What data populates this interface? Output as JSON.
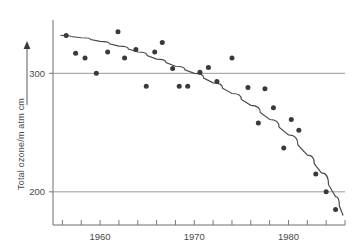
{
  "chart_data": {
    "type": "scatter",
    "title": "",
    "xlabel": "",
    "ylabel": "Total ozone/m atm cm",
    "xlim": [
      1955.0,
      1986.0
    ],
    "ylim": [
      172,
      345
    ],
    "grid": "horizontal gridlines at y = 200 and y = 300 only",
    "legend": "none",
    "x_tick_labels": [
      "1960",
      "1970",
      "1980"
    ],
    "x_tick_values": [
      1960,
      1970,
      1980
    ],
    "x_minor_tick_values": [
      1956,
      1958,
      1960,
      1962,
      1964,
      1966,
      1968,
      1970,
      1972,
      1974,
      1976,
      1978,
      1980,
      1982,
      1984,
      1986
    ],
    "y_tick_labels": [
      "300",
      "200"
    ],
    "y_tick_values": [
      300,
      200
    ],
    "series": [
      {
        "name": "Total ozone measurements",
        "marker": "filled circle",
        "color": "#3a3a3a",
        "points": [
          {
            "x": 1956.4,
            "y": 332
          },
          {
            "x": 1957.4,
            "y": 317
          },
          {
            "x": 1958.4,
            "y": 313
          },
          {
            "x": 1959.6,
            "y": 300
          },
          {
            "x": 1960.8,
            "y": 318
          },
          {
            "x": 1961.9,
            "y": 335
          },
          {
            "x": 1962.6,
            "y": 313
          },
          {
            "x": 1963.8,
            "y": 320
          },
          {
            "x": 1964.9,
            "y": 289
          },
          {
            "x": 1965.8,
            "y": 318
          },
          {
            "x": 1966.6,
            "y": 326
          },
          {
            "x": 1967.7,
            "y": 304
          },
          {
            "x": 1968.4,
            "y": 289
          },
          {
            "x": 1969.3,
            "y": 289
          },
          {
            "x": 1970.6,
            "y": 301
          },
          {
            "x": 1971.5,
            "y": 305
          },
          {
            "x": 1972.4,
            "y": 293
          },
          {
            "x": 1974.0,
            "y": 313
          },
          {
            "x": 1975.7,
            "y": 288
          },
          {
            "x": 1976.8,
            "y": 258
          },
          {
            "x": 1977.5,
            "y": 287
          },
          {
            "x": 1978.4,
            "y": 271
          },
          {
            "x": 1979.5,
            "y": 237
          },
          {
            "x": 1980.3,
            "y": 261
          },
          {
            "x": 1981.1,
            "y": 252
          },
          {
            "x": 1982.9,
            "y": 215
          },
          {
            "x": 1984.0,
            "y": 200
          },
          {
            "x": 1985.0,
            "y": 185
          }
        ]
      }
    ],
    "fit_curve": {
      "name": "fitted decline trend",
      "color": "#4a4a4a",
      "points": [
        {
          "x": 1955.8,
          "y": 332
        },
        {
          "x": 1958.0,
          "y": 330
        },
        {
          "x": 1960.0,
          "y": 327
        },
        {
          "x": 1962.0,
          "y": 323
        },
        {
          "x": 1964.0,
          "y": 318
        },
        {
          "x": 1966.0,
          "y": 312
        },
        {
          "x": 1968.0,
          "y": 306
        },
        {
          "x": 1970.0,
          "y": 300
        },
        {
          "x": 1972.0,
          "y": 292
        },
        {
          "x": 1974.0,
          "y": 283
        },
        {
          "x": 1976.0,
          "y": 273
        },
        {
          "x": 1978.0,
          "y": 261
        },
        {
          "x": 1980.0,
          "y": 248
        },
        {
          "x": 1982.0,
          "y": 231
        },
        {
          "x": 1983.5,
          "y": 216
        },
        {
          "x": 1985.0,
          "y": 196
        },
        {
          "x": 1985.8,
          "y": 180
        }
      ]
    }
  }
}
